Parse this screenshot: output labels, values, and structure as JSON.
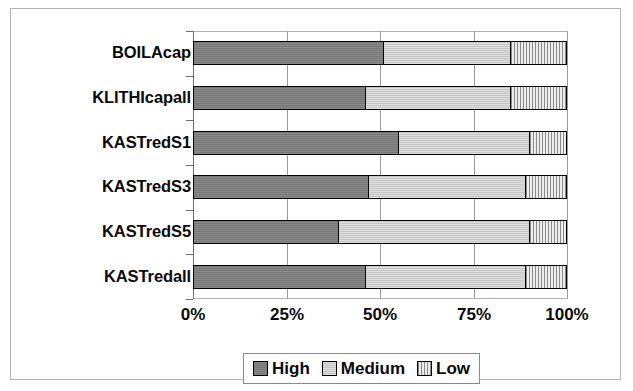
{
  "chart_data": {
    "type": "bar",
    "orientation": "horizontal",
    "stacked": true,
    "normalized": true,
    "title": "",
    "xlabel": "",
    "ylabel": "",
    "xlim": [
      0,
      100
    ],
    "xticks": [
      "0%",
      "25%",
      "50%",
      "75%",
      "100%"
    ],
    "xtick_values": [
      0,
      25,
      50,
      75,
      100
    ],
    "grid": true,
    "grid_axis": "x",
    "legend_position": "bottom",
    "categories": [
      "BOILAcap",
      "KLITHIcapall",
      "KASTredS1",
      "KASTredS3",
      "KASTredS5",
      "KASTredall"
    ],
    "series": [
      {
        "name": "High",
        "color": "#7d7d7d",
        "values": [
          51,
          46,
          55,
          47,
          39,
          46
        ]
      },
      {
        "name": "Medium",
        "color": "#cfcfcf",
        "values": [
          34,
          39,
          35,
          42,
          51,
          43
        ]
      },
      {
        "name": "Low",
        "color": "#dcdcdc",
        "pattern": "vertical-hatch",
        "values": [
          15,
          15,
          10,
          11,
          10,
          11
        ]
      }
    ],
    "rows": [
      {
        "category": "BOILAcap",
        "High": 51,
        "Medium": 34,
        "Low": 15
      },
      {
        "category": "KLITHIcapall",
        "High": 46,
        "Medium": 39,
        "Low": 15
      },
      {
        "category": "KASTredS1",
        "High": 55,
        "Medium": 35,
        "Low": 10
      },
      {
        "category": "KASTredS3",
        "High": 47,
        "Medium": 42,
        "Low": 11
      },
      {
        "category": "KASTredS5",
        "High": 39,
        "Medium": 51,
        "Low": 10
      },
      {
        "category": "KASTredall",
        "High": 46,
        "Medium": 43,
        "Low": 11
      }
    ]
  },
  "legend": {
    "items": [
      {
        "label": "High",
        "swatch": "high-swatch"
      },
      {
        "label": "Medium",
        "swatch": "medium-swatch"
      },
      {
        "label": "Low",
        "swatch": "low-swatch"
      }
    ]
  },
  "colors": {
    "high": "#7d7d7d",
    "medium": "#cfcfcf",
    "low": "#dcdcdc",
    "outline": "#000000",
    "grid": "#9a9a9a",
    "frame": "#b3b3b3",
    "text": "#0a0a0a"
  }
}
